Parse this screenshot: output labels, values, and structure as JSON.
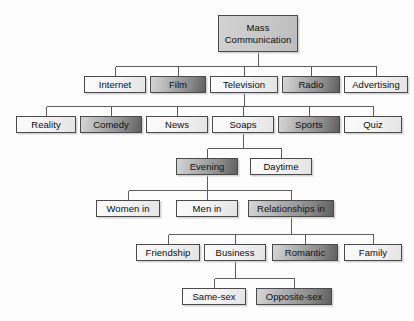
{
  "diagram": {
    "type": "hierarchy-tree",
    "orientation": "top-down",
    "colors": {
      "light_fill": "#f4f4f4",
      "dark_fill": "#8a8a8a",
      "root_fill": "#c9c9c9",
      "border": "#4a4a4a",
      "text": "#0d0d0d",
      "background": "#fdfdfd"
    },
    "nodes": [
      {
        "id": "mass-communication",
        "label": "Mass",
        "label_line2": "Communication",
        "shade": "root",
        "level": 0,
        "x": 218,
        "y": 15,
        "w": 80,
        "h": 37
      },
      {
        "id": "internet",
        "label": "Internet",
        "shade": "light",
        "level": 1,
        "x": 84,
        "y": 76,
        "w": 62,
        "h": 17
      },
      {
        "id": "film",
        "label": "Film",
        "shade": "dark",
        "level": 1,
        "x": 150,
        "y": 76,
        "w": 56,
        "h": 17
      },
      {
        "id": "television",
        "label": "Television",
        "shade": "light",
        "level": 1,
        "x": 210,
        "y": 76,
        "w": 68,
        "h": 17
      },
      {
        "id": "radio",
        "label": "Radio",
        "shade": "dark",
        "level": 1,
        "x": 282,
        "y": 76,
        "w": 58,
        "h": 17
      },
      {
        "id": "advertising",
        "label": "Advertising",
        "shade": "light",
        "level": 1,
        "x": 344,
        "y": 76,
        "w": 64,
        "h": 17
      },
      {
        "id": "reality",
        "label": "Reality",
        "shade": "light",
        "level": 2,
        "x": 16,
        "y": 116,
        "w": 60,
        "h": 17
      },
      {
        "id": "comedy",
        "label": "Comedy",
        "shade": "dark",
        "level": 2,
        "x": 80,
        "y": 116,
        "w": 62,
        "h": 17
      },
      {
        "id": "news",
        "label": "News",
        "shade": "light",
        "level": 2,
        "x": 146,
        "y": 116,
        "w": 62,
        "h": 17
      },
      {
        "id": "soaps",
        "label": "Soaps",
        "shade": "light",
        "level": 2,
        "x": 212,
        "y": 116,
        "w": 62,
        "h": 17
      },
      {
        "id": "sports",
        "label": "Sports",
        "shade": "dark",
        "level": 2,
        "x": 278,
        "y": 116,
        "w": 62,
        "h": 17
      },
      {
        "id": "quiz",
        "label": "Quiz",
        "shade": "light",
        "level": 2,
        "x": 344,
        "y": 116,
        "w": 58,
        "h": 17
      },
      {
        "id": "evening",
        "label": "Evening",
        "shade": "dark",
        "level": 3,
        "x": 176,
        "y": 158,
        "w": 62,
        "h": 17
      },
      {
        "id": "daytime",
        "label": "Daytime",
        "shade": "light",
        "level": 3,
        "x": 250,
        "y": 158,
        "w": 62,
        "h": 17
      },
      {
        "id": "women-in",
        "label": "Women in",
        "shade": "light",
        "level": 4,
        "x": 96,
        "y": 200,
        "w": 64,
        "h": 17
      },
      {
        "id": "men-in",
        "label": "Men in",
        "shade": "light",
        "level": 4,
        "x": 176,
        "y": 200,
        "w": 62,
        "h": 17
      },
      {
        "id": "relationships-in",
        "label": "Relationships in",
        "shade": "dark",
        "level": 4,
        "x": 248,
        "y": 200,
        "w": 86,
        "h": 17
      },
      {
        "id": "friendship",
        "label": "Friendship",
        "shade": "light",
        "level": 5,
        "x": 136,
        "y": 244,
        "w": 64,
        "h": 17
      },
      {
        "id": "business",
        "label": "Business",
        "shade": "light",
        "level": 5,
        "x": 204,
        "y": 244,
        "w": 62,
        "h": 17
      },
      {
        "id": "romantic",
        "label": "Romantic",
        "shade": "dark",
        "level": 5,
        "x": 272,
        "y": 244,
        "w": 66,
        "h": 17
      },
      {
        "id": "family",
        "label": "Family",
        "shade": "light",
        "level": 5,
        "x": 344,
        "y": 244,
        "w": 58,
        "h": 17
      },
      {
        "id": "same-sex",
        "label": "Same-sex",
        "shade": "light",
        "level": 6,
        "x": 182,
        "y": 288,
        "w": 64,
        "h": 17
      },
      {
        "id": "opposite-sex",
        "label": "Opposite-sex",
        "shade": "dark",
        "level": 6,
        "x": 256,
        "y": 288,
        "w": 76,
        "h": 17
      }
    ],
    "edges": [
      {
        "from": "mass-communication",
        "to": "internet"
      },
      {
        "from": "mass-communication",
        "to": "film"
      },
      {
        "from": "mass-communication",
        "to": "television"
      },
      {
        "from": "mass-communication",
        "to": "radio"
      },
      {
        "from": "mass-communication",
        "to": "advertising"
      },
      {
        "from": "television",
        "to": "reality"
      },
      {
        "from": "television",
        "to": "comedy"
      },
      {
        "from": "television",
        "to": "news"
      },
      {
        "from": "television",
        "to": "soaps"
      },
      {
        "from": "television",
        "to": "sports"
      },
      {
        "from": "television",
        "to": "quiz"
      },
      {
        "from": "soaps",
        "to": "evening"
      },
      {
        "from": "soaps",
        "to": "daytime"
      },
      {
        "from": "evening",
        "to": "women-in"
      },
      {
        "from": "evening",
        "to": "men-in"
      },
      {
        "from": "evening",
        "to": "relationships-in"
      },
      {
        "from": "relationships-in",
        "to": "friendship"
      },
      {
        "from": "relationships-in",
        "to": "business"
      },
      {
        "from": "relationships-in",
        "to": "romantic"
      },
      {
        "from": "relationships-in",
        "to": "family"
      },
      {
        "from": "business",
        "to": "same-sex"
      },
      {
        "from": "business",
        "to": "opposite-sex"
      }
    ]
  }
}
